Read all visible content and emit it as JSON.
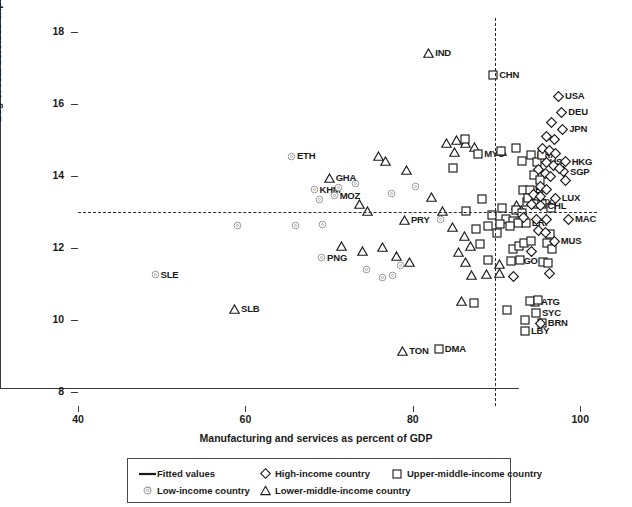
{
  "chart_data": {
    "type": "scatter",
    "title": "",
    "xlabel": "Manufacturing and services as percent of GDP",
    "ylabel": "Log of real services exports per capita",
    "xlim": [
      40,
      102
    ],
    "ylim": [
      7.6,
      18.4
    ],
    "xticks": [
      40,
      60,
      80,
      100
    ],
    "yticks": [
      8,
      10,
      12,
      14,
      16,
      18
    ],
    "grid": false,
    "reference_lines": [
      {
        "orientation": "horizontal",
        "value": 13.0,
        "style": "dashed"
      },
      {
        "orientation": "vertical",
        "value": 89.8,
        "style": "dashed"
      }
    ],
    "legend_position": "below-axes",
    "series": [
      {
        "name": "Low-income country",
        "marker": "circle",
        "points": [
          {
            "label": "ETH",
            "x": 65.5,
            "y": 14.55
          },
          {
            "label": "KHM",
            "x": 68.2,
            "y": 13.62
          },
          {
            "label": "",
            "x": 68.9,
            "y": 13.35
          },
          {
            "label": "MOZ",
            "x": 70.6,
            "y": 13.45
          },
          {
            "label": "",
            "x": 73.1,
            "y": 13.78
          },
          {
            "label": "",
            "x": 71.1,
            "y": 13.68
          },
          {
            "label": "",
            "x": 77.5,
            "y": 13.52
          },
          {
            "label": "",
            "x": 80.3,
            "y": 13.7
          },
          {
            "label": "",
            "x": 59.0,
            "y": 12.63
          },
          {
            "label": "",
            "x": 66.0,
            "y": 12.62
          },
          {
            "label": "",
            "x": 69.2,
            "y": 12.66
          },
          {
            "label": "",
            "x": 74.5,
            "y": 11.4
          },
          {
            "label": "",
            "x": 76.4,
            "y": 11.18
          },
          {
            "label": "",
            "x": 77.6,
            "y": 11.22
          },
          {
            "label": "",
            "x": 83.3,
            "y": 12.78
          },
          {
            "label": "SLE",
            "x": 49.2,
            "y": 11.26
          },
          {
            "label": "PNG",
            "x": 69.1,
            "y": 11.73
          },
          {
            "label": "",
            "x": 78.5,
            "y": 11.52
          }
        ]
      },
      {
        "name": "Lower-middle-income country",
        "marker": "triangle",
        "points": [
          {
            "label": "IND",
            "x": 81.9,
            "y": 17.42
          },
          {
            "label": "GHA",
            "x": 70.0,
            "y": 13.94
          },
          {
            "label": "PRY",
            "x": 79.0,
            "y": 12.78
          },
          {
            "label": "SLB",
            "x": 58.7,
            "y": 10.3
          },
          {
            "label": "TON",
            "x": 78.8,
            "y": 9.12
          },
          {
            "label": "",
            "x": 75.9,
            "y": 14.55
          },
          {
            "label": "",
            "x": 76.7,
            "y": 14.42
          },
          {
            "label": "",
            "x": 79.2,
            "y": 14.18
          },
          {
            "label": "",
            "x": 73.6,
            "y": 13.22
          },
          {
            "label": "",
            "x": 74.6,
            "y": 13.02
          },
          {
            "label": "",
            "x": 71.5,
            "y": 12.06
          },
          {
            "label": "",
            "x": 74.0,
            "y": 11.92
          },
          {
            "label": "",
            "x": 76.4,
            "y": 12.02
          },
          {
            "label": "",
            "x": 78.0,
            "y": 11.78
          },
          {
            "label": "",
            "x": 79.6,
            "y": 11.62
          },
          {
            "label": "",
            "x": 82.2,
            "y": 13.42
          },
          {
            "label": "",
            "x": 84.0,
            "y": 14.92
          },
          {
            "label": "",
            "x": 85.2,
            "y": 15.0
          },
          {
            "label": "",
            "x": 85.0,
            "y": 14.68
          },
          {
            "label": "",
            "x": 86.3,
            "y": 14.92
          },
          {
            "label": "",
            "x": 87.4,
            "y": 14.8
          },
          {
            "label": "",
            "x": 90.6,
            "y": 14.7
          },
          {
            "label": "",
            "x": 84.7,
            "y": 12.58
          },
          {
            "label": "",
            "x": 86.2,
            "y": 12.32
          },
          {
            "label": "",
            "x": 85.4,
            "y": 11.9
          },
          {
            "label": "",
            "x": 86.3,
            "y": 11.6
          },
          {
            "label": "",
            "x": 86.9,
            "y": 12.06
          },
          {
            "label": "",
            "x": 87.0,
            "y": 11.26
          },
          {
            "label": "",
            "x": 85.8,
            "y": 10.52
          },
          {
            "label": "",
            "x": 88.8,
            "y": 11.28
          },
          {
            "label": "",
            "x": 90.3,
            "y": 11.54
          },
          {
            "label": "",
            "x": 90.4,
            "y": 11.3
          },
          {
            "label": "",
            "x": 83.5,
            "y": 13.04
          },
          {
            "label": "",
            "x": 92.4,
            "y": 13.2
          },
          {
            "label": "",
            "x": 93.0,
            "y": 13.05
          }
        ]
      },
      {
        "name": "Upper-middle-income country",
        "marker": "square",
        "points": [
          {
            "label": "CHN",
            "x": 89.6,
            "y": 16.8
          },
          {
            "label": "MYS",
            "x": 87.8,
            "y": 14.62
          },
          {
            "label": "DMA",
            "x": 83.1,
            "y": 9.18
          },
          {
            "label": "LBY",
            "x": 93.4,
            "y": 9.68
          },
          {
            "label": "ATG",
            "x": 94.6,
            "y": 10.5
          },
          {
            "label": "SYC",
            "x": 94.7,
            "y": 10.2
          },
          {
            "label": "BRN",
            "x": 95.4,
            "y": 9.92
          },
          {
            "label": "LBN",
            "x": 93.2,
            "y": 13.62
          },
          {
            "label": "BRA",
            "x": 94.1,
            "y": 14.6
          },
          {
            "label": "RUS",
            "x": 94.8,
            "y": 14.4
          },
          {
            "label": "MEX",
            "x": 93.6,
            "y": 13.28
          },
          {
            "label": "ERI",
            "x": 93.5,
            "y": 12.7
          },
          {
            "label": "AGO",
            "x": 91.7,
            "y": 11.64
          },
          {
            "label": "",
            "x": 86.2,
            "y": 15.02
          },
          {
            "label": "",
            "x": 84.8,
            "y": 14.22
          },
          {
            "label": "",
            "x": 90.5,
            "y": 14.7
          },
          {
            "label": "",
            "x": 92.3,
            "y": 14.78
          },
          {
            "label": "",
            "x": 95.4,
            "y": 14.6
          },
          {
            "label": "",
            "x": 93.1,
            "y": 14.42
          },
          {
            "label": "",
            "x": 94.5,
            "y": 14.02
          },
          {
            "label": "",
            "x": 95.2,
            "y": 13.9
          },
          {
            "label": "",
            "x": 94.0,
            "y": 13.6
          },
          {
            "label": "",
            "x": 93.8,
            "y": 13.4
          },
          {
            "label": "",
            "x": 92.3,
            "y": 13.05
          },
          {
            "label": "",
            "x": 93.1,
            "y": 12.98
          },
          {
            "label": "",
            "x": 94.6,
            "y": 13.22
          },
          {
            "label": "",
            "x": 95.4,
            "y": 13.22
          },
          {
            "label": "",
            "x": 90.6,
            "y": 13.1
          },
          {
            "label": "",
            "x": 89.4,
            "y": 12.92
          },
          {
            "label": "",
            "x": 91.1,
            "y": 12.8
          },
          {
            "label": "",
            "x": 92.0,
            "y": 12.74
          },
          {
            "label": "",
            "x": 92.6,
            "y": 12.7
          },
          {
            "label": "",
            "x": 91.6,
            "y": 12.62
          },
          {
            "label": "",
            "x": 90.4,
            "y": 12.66
          },
          {
            "label": "",
            "x": 92.0,
            "y": 11.98
          },
          {
            "label": "",
            "x": 92.7,
            "y": 12.06
          },
          {
            "label": "",
            "x": 93.3,
            "y": 12.14
          },
          {
            "label": "",
            "x": 94.1,
            "y": 12.2
          },
          {
            "label": "",
            "x": 96.0,
            "y": 12.14
          },
          {
            "label": "",
            "x": 96.4,
            "y": 12.38
          },
          {
            "label": "",
            "x": 96.6,
            "y": 11.98
          },
          {
            "label": "",
            "x": 95.6,
            "y": 11.62
          },
          {
            "label": "",
            "x": 96.1,
            "y": 11.58
          },
          {
            "label": "",
            "x": 92.8,
            "y": 11.66
          },
          {
            "label": "",
            "x": 89.0,
            "y": 11.66
          },
          {
            "label": "",
            "x": 88.0,
            "y": 12.1
          },
          {
            "label": "",
            "x": 87.6,
            "y": 12.52
          },
          {
            "label": "",
            "x": 89.0,
            "y": 12.62
          },
          {
            "label": "",
            "x": 90.0,
            "y": 12.42
          },
          {
            "label": "",
            "x": 86.4,
            "y": 13.02
          },
          {
            "label": "",
            "x": 88.3,
            "y": 13.36
          },
          {
            "label": "",
            "x": 87.3,
            "y": 10.48
          },
          {
            "label": "",
            "x": 91.2,
            "y": 10.28
          },
          {
            "label": "",
            "x": 93.4,
            "y": 10.0
          },
          {
            "label": "",
            "x": 94.0,
            "y": 10.52
          },
          {
            "label": "",
            "x": 95.0,
            "y": 10.56
          },
          {
            "label": "",
            "x": 96.5,
            "y": 13.12
          }
        ]
      },
      {
        "name": "High-income country",
        "marker": "diamond",
        "points": [
          {
            "label": "USA",
            "x": 97.4,
            "y": 16.22
          },
          {
            "label": "DEU",
            "x": 97.8,
            "y": 15.78
          },
          {
            "label": "JPN",
            "x": 97.9,
            "y": 15.3
          },
          {
            "label": "HKG",
            "x": 98.2,
            "y": 14.4
          },
          {
            "label": "SGP",
            "x": 98.0,
            "y": 14.12
          },
          {
            "label": "LUX",
            "x": 97.0,
            "y": 13.38
          },
          {
            "label": "MAC",
            "x": 98.6,
            "y": 12.8
          },
          {
            "label": "MUS",
            "x": 96.9,
            "y": 12.18
          },
          {
            "label": "CHL",
            "x": 95.3,
            "y": 13.18
          },
          {
            "label": "",
            "x": 96.6,
            "y": 15.48
          },
          {
            "label": "",
            "x": 96.0,
            "y": 15.1
          },
          {
            "label": "",
            "x": 96.9,
            "y": 15.02
          },
          {
            "label": "",
            "x": 95.5,
            "y": 14.78
          },
          {
            "label": "",
            "x": 96.3,
            "y": 14.7
          },
          {
            "label": "",
            "x": 97.1,
            "y": 14.62
          },
          {
            "label": "",
            "x": 96.0,
            "y": 14.38
          },
          {
            "label": "",
            "x": 96.8,
            "y": 14.3
          },
          {
            "label": "",
            "x": 97.5,
            "y": 14.22
          },
          {
            "label": "",
            "x": 95.0,
            "y": 14.18
          },
          {
            "label": "",
            "x": 95.8,
            "y": 14.06
          },
          {
            "label": "",
            "x": 96.5,
            "y": 13.98
          },
          {
            "label": "",
            "x": 95.2,
            "y": 13.72
          },
          {
            "label": "",
            "x": 96.0,
            "y": 13.62
          },
          {
            "label": "",
            "x": 94.4,
            "y": 13.48
          },
          {
            "label": "",
            "x": 95.2,
            "y": 13.42
          },
          {
            "label": "",
            "x": 94.2,
            "y": 13.2
          },
          {
            "label": "",
            "x": 93.2,
            "y": 12.86
          },
          {
            "label": "",
            "x": 94.8,
            "y": 12.8
          },
          {
            "label": "",
            "x": 96.0,
            "y": 12.78
          },
          {
            "label": "",
            "x": 95.0,
            "y": 12.48
          },
          {
            "label": "",
            "x": 95.8,
            "y": 12.42
          },
          {
            "label": "",
            "x": 94.2,
            "y": 11.9
          },
          {
            "label": "",
            "x": 96.3,
            "y": 11.28
          },
          {
            "label": "",
            "x": 95.3,
            "y": 9.9
          },
          {
            "label": "",
            "x": 92.0,
            "y": 11.2
          },
          {
            "label": "",
            "x": 98.2,
            "y": 13.88
          }
        ]
      }
    ]
  },
  "axes": {
    "ytick_labels": [
      "18",
      "16",
      "14",
      "12",
      "10",
      "8"
    ],
    "xtick_labels": [
      "40",
      "60",
      "80",
      "100"
    ],
    "ylabel": "Log of real services exports per capita",
    "xlabel": "Manufacturing and services as percent of GDP"
  },
  "legend": {
    "entries": [
      {
        "label": "Fitted values",
        "marker": "line"
      },
      {
        "label": "High-income country",
        "marker": "diamond"
      },
      {
        "label": "Upper-middle-income country",
        "marker": "square"
      },
      {
        "label": "Low-income country",
        "marker": "circle"
      },
      {
        "label": "Lower-middle-income country",
        "marker": "triangle"
      }
    ]
  },
  "colors": {
    "axis": "#3a3a3a",
    "marker_stroke": "#1a1a1a",
    "text": "#1a1a1a",
    "low_income_stroke": "#8c8c8c",
    "background": "#ffffff"
  }
}
